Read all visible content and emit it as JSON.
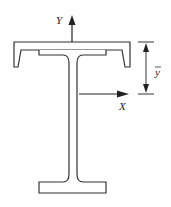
{
  "diagram": {
    "title": "",
    "labels": {
      "y_axis": "Y",
      "x_axis": "X",
      "ybar": "y"
    },
    "components": [
      {
        "name": "channel-section",
        "orientation": "inverted, web on top"
      },
      {
        "name": "i-beam",
        "parts": [
          "top-flange",
          "web",
          "bottom-flange"
        ]
      },
      {
        "name": "y-axis-arrow",
        "direction": "up"
      },
      {
        "name": "x-axis-arrow",
        "direction": "right"
      },
      {
        "name": "ybar-dimension",
        "from": "top of channel",
        "to": "neutral axis X"
      }
    ],
    "colors": {
      "stroke": "#333333",
      "fill": "#ffffff"
    }
  }
}
